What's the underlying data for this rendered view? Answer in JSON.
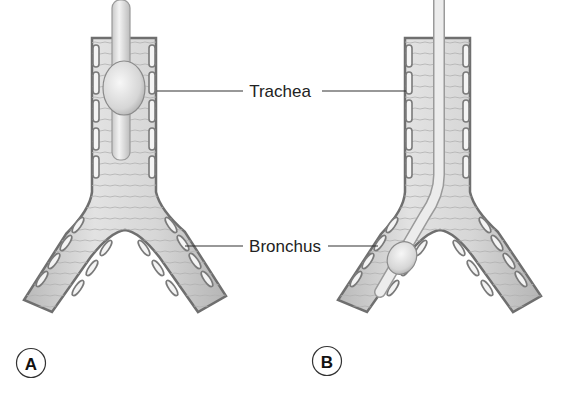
{
  "figure": {
    "labels": {
      "trachea": "Trachea",
      "bronchus": "Bronchus"
    },
    "panels": [
      {
        "id": "A",
        "letter": "A",
        "tube_position": "trachea"
      },
      {
        "id": "B",
        "letter": "B",
        "tube_position": "bronchus"
      }
    ],
    "colors": {
      "tissue_fill": "#d9d9d9",
      "tissue_shade": "#bdbdbd",
      "cartilage_outline": "#7a7a7a",
      "tube_fill": "#e6e6e6",
      "leader_line": "#333333",
      "text": "#222222"
    }
  }
}
